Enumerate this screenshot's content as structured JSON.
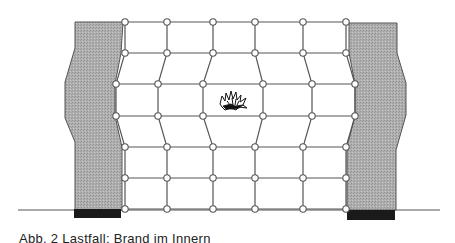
{
  "figure": {
    "caption": "Abb. 2  Lastfall: Brand im Innern",
    "colors": {
      "line": "#555555",
      "wall_fill": "#a8a8a8",
      "foundation": "#1a1a1a",
      "node_fill": "#ffffff",
      "explosion": "#111111"
    },
    "ground_line": {
      "x1": 18,
      "x2": 440,
      "y": 210
    },
    "left_wall": {
      "outline": [
        [
          75,
          22
        ],
        [
          123,
          22
        ],
        [
          121,
          53
        ],
        [
          115,
          84
        ],
        [
          115,
          116
        ],
        [
          122,
          147
        ],
        [
          122,
          210
        ],
        [
          75,
          210
        ],
        [
          75,
          142
        ],
        [
          65,
          118
        ],
        [
          65,
          82
        ],
        [
          75,
          48
        ]
      ],
      "foundation": {
        "x": 74,
        "y": 209,
        "w": 47,
        "h": 9
      }
    },
    "right_wall": {
      "outline": [
        [
          349,
          23
        ],
        [
          397,
          23
        ],
        [
          397,
          53
        ],
        [
          406,
          83
        ],
        [
          406,
          115
        ],
        [
          396,
          150
        ],
        [
          396,
          210
        ],
        [
          347,
          210
        ],
        [
          347,
          147
        ],
        [
          355,
          116
        ],
        [
          355,
          84
        ],
        [
          349,
          53
        ]
      ],
      "foundation": {
        "x": 347,
        "y": 210,
        "w": 48,
        "h": 10
      }
    },
    "grid": {
      "rows": [
        [
          [
            125,
            22
          ],
          [
            167,
            22
          ],
          [
            213,
            22
          ],
          [
            255,
            22
          ],
          [
            303,
            22
          ],
          [
            346,
            22
          ]
        ],
        [
          [
            125,
            53
          ],
          [
            167,
            53
          ],
          [
            213,
            53
          ],
          [
            255,
            53
          ],
          [
            303,
            53
          ],
          [
            346,
            53
          ]
        ],
        [
          [
            116,
            84
          ],
          [
            158,
            84
          ],
          [
            203,
            84
          ],
          [
            263,
            84
          ],
          [
            312,
            84
          ],
          [
            355,
            84
          ]
        ],
        [
          [
            116,
            116
          ],
          [
            158,
            116
          ],
          [
            203,
            116
          ],
          [
            263,
            116
          ],
          [
            312,
            116
          ],
          [
            355,
            116
          ]
        ],
        [
          [
            125,
            147
          ],
          [
            167,
            147
          ],
          [
            213,
            147
          ],
          [
            255,
            147
          ],
          [
            303,
            147
          ],
          [
            346,
            147
          ]
        ],
        [
          [
            125,
            178
          ],
          [
            167,
            178
          ],
          [
            213,
            178
          ],
          [
            255,
            178
          ],
          [
            303,
            178
          ],
          [
            346,
            178
          ]
        ],
        [
          [
            125,
            209
          ],
          [
            167,
            209
          ],
          [
            213,
            209
          ],
          [
            255,
            209
          ],
          [
            303,
            209
          ],
          [
            346,
            209
          ]
        ]
      ],
      "node_radius": 3.2
    },
    "explosion": {
      "cx": 233,
      "cy": 102,
      "label": "explosion-icon"
    }
  }
}
